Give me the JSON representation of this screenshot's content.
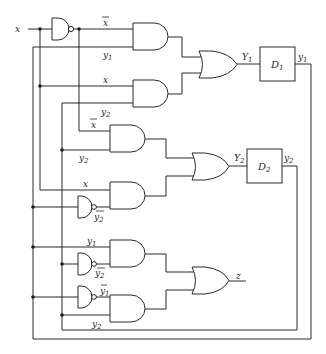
{
  "diagram": {
    "type": "sequential-logic-circuit",
    "input": {
      "label": "x"
    },
    "output": {
      "label": "z"
    },
    "inverters": [
      {
        "id": "nand-x",
        "output_label": "x",
        "output_overbar": true
      },
      {
        "id": "nand-y2-a",
        "output_label": "y2",
        "output_overbar": true
      },
      {
        "id": "nand-y2-b",
        "output_label": "y2",
        "output_overbar": true
      },
      {
        "id": "nand-y1",
        "output_label": "y1",
        "output_overbar": true
      }
    ],
    "and_gates": [
      {
        "id": "and1",
        "inputs": [
          "x̄",
          "y1"
        ]
      },
      {
        "id": "and2",
        "inputs": [
          "x",
          "y2"
        ]
      },
      {
        "id": "and3",
        "inputs": [
          "x̄",
          "y2"
        ]
      },
      {
        "id": "and4",
        "inputs": [
          "x",
          "ȳ2"
        ]
      },
      {
        "id": "and5",
        "inputs": [
          "y1",
          "ȳ2"
        ]
      },
      {
        "id": "and6",
        "inputs": [
          "ȳ1",
          "y2"
        ]
      }
    ],
    "or_gates": [
      {
        "id": "or1",
        "output_label": "Y1"
      },
      {
        "id": "or2",
        "output_label": "Y2"
      },
      {
        "id": "or3",
        "output_label": "z"
      }
    ],
    "flip_flops": [
      {
        "id": "d1",
        "label": "D1",
        "input_label": "Y1",
        "output_label": "y1"
      },
      {
        "id": "d2",
        "label": "D2",
        "input_label": "Y2",
        "output_label": "y2"
      }
    ],
    "labels": {
      "x_in": "x",
      "xbar_and1": "x",
      "y1_and1": "y",
      "y1_and1_sub": "1",
      "x_and2": "x",
      "y2_and2": "y",
      "y2_and2_sub": "2",
      "xbar_and3": "x",
      "y2_and3": "y",
      "y2_and3_sub": "2",
      "x_and4": "x",
      "y2bar_and4": "y",
      "y2bar_and4_sub": "2",
      "y1_and5": "y",
      "y1_and5_sub": "1",
      "y2bar_and5": "y",
      "y2bar_and5_sub": "2",
      "y1bar_and6": "y",
      "y1bar_and6_sub": "1",
      "y2_and6": "y",
      "y2_and6_sub": "2",
      "Y1_main": "Y",
      "Y1_sub": "1",
      "D1_main": "D",
      "D1_sub": "1",
      "y1_out": "y",
      "y1_out_sub": "1",
      "Y2_main": "Y",
      "Y2_sub": "2",
      "D2_main": "D",
      "D2_sub": "2",
      "y2_out": "y",
      "y2_out_sub": "2",
      "z_out": "z"
    }
  }
}
